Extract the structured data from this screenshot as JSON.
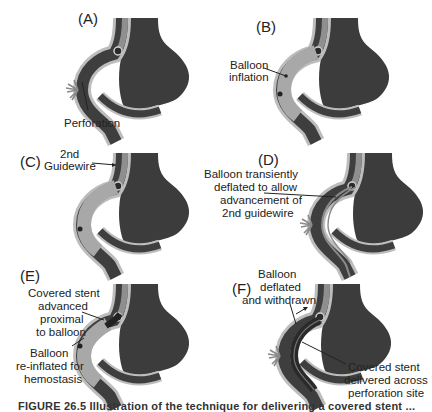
{
  "figure": {
    "panels": [
      {
        "id": "A",
        "label": "(A)",
        "annotations": [
          "Perforation"
        ]
      },
      {
        "id": "B",
        "label": "(B)",
        "annotations": [
          "Balloon",
          "inflation"
        ]
      },
      {
        "id": "C",
        "label": "(C)",
        "annotations": [
          "2nd",
          "Guidewire"
        ]
      },
      {
        "id": "D",
        "label": "(D)",
        "annotations": [
          "Balloon transiently",
          "deflated to allow",
          "advancement of",
          "2nd guidewire"
        ]
      },
      {
        "id": "E",
        "label": "(E)",
        "annotations": [
          "Covered stent",
          "advanced",
          "proximal",
          "to balloon",
          "Balloon",
          "re-inflated for",
          "hemostasis"
        ]
      },
      {
        "id": "F",
        "label": "(F)",
        "annotations": [
          "Balloon",
          "deflated",
          "and withdrawn",
          "Covered stent",
          "delivered across",
          "perforation site"
        ]
      }
    ],
    "caption": "FIGURE 26.5  Illustration of the technique for delivering a covered stent ...",
    "colors": {
      "aneurysm": "#3c3c3c",
      "vessel_wall": "#9a9a9a",
      "lumen": "#3e3e3e",
      "balloon": "#a8a8a8",
      "background": "#ffffff"
    }
  }
}
